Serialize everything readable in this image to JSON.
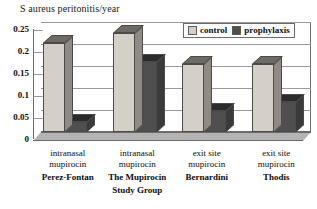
{
  "chart_data": {
    "type": "bar",
    "title": "S aureus peritonitis/year",
    "xlabel": "",
    "ylabel": "",
    "ylim": [
      0,
      0.25
    ],
    "grid": true,
    "legend_position": "top-right",
    "y_ticks": [
      "0.25",
      "0.2",
      "0.15",
      "0.1",
      "0.05",
      "0"
    ],
    "y_tick_values": [
      0.25,
      0.2,
      0.15,
      0.1,
      0.05,
      0
    ],
    "categories": [
      "intranasal mupirocin Perez-Fontan",
      "intranasal mupirocin The Mupirocin Study Group",
      "exit site mupirocin Bernardini",
      "exit site mupirocin Thodis"
    ],
    "category_lines": [
      [
        "intranasal",
        "mupirocin",
        "Perez-Fontan"
      ],
      [
        "intranasal",
        "mupirocin",
        "The Mupirocin",
        "Study Group"
      ],
      [
        "exit site",
        "mupirocin",
        "Bernardini"
      ],
      [
        "exit site",
        "mupirocin",
        "Thodis"
      ]
    ],
    "series": [
      {
        "name": "control",
        "color": "#d4d0c8",
        "values": [
          0.202,
          0.225,
          0.155,
          0.155
        ]
      },
      {
        "name": "prophylaxis",
        "color": "#4f4f4f",
        "values": [
          0.022,
          0.158,
          0.048,
          0.068
        ]
      }
    ]
  },
  "legend": {
    "items": [
      {
        "label": "control"
      },
      {
        "label": "prophylaxis"
      }
    ]
  }
}
